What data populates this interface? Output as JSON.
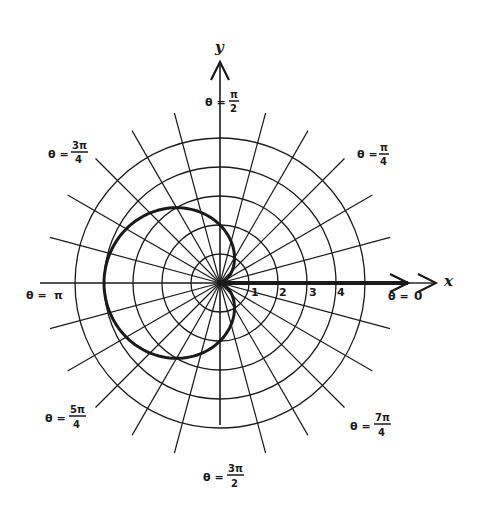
{
  "figure": {
    "title": "",
    "axes": {
      "x_label": "x",
      "y_label": "y"
    },
    "ring_tick_labels": [
      "1",
      "2",
      "3",
      "4"
    ],
    "angle_labels": [
      {
        "id": "theta_0",
        "prefix": "θ =",
        "num": "0",
        "den": ""
      },
      {
        "id": "theta_pi4",
        "prefix": "θ =",
        "num": "π",
        "den": "4"
      },
      {
        "id": "theta_pi2",
        "prefix": "θ =",
        "num": "π",
        "den": "2"
      },
      {
        "id": "theta_3pi4",
        "prefix": "θ =",
        "num": "3π",
        "den": "4"
      },
      {
        "id": "theta_pi",
        "prefix": "θ =",
        "num": "π",
        "den": ""
      },
      {
        "id": "theta_5pi4",
        "prefix": "θ =",
        "num": "5π",
        "den": "4"
      },
      {
        "id": "theta_3pi2",
        "prefix": "θ =",
        "num": "3π",
        "den": "2"
      },
      {
        "id": "theta_7pi4",
        "prefix": "θ =",
        "num": "7π",
        "den": "4"
      }
    ],
    "colors": {
      "ink": "#1a1a1a",
      "background": "#ffffff"
    }
  },
  "chart_data": {
    "type": "polar-line",
    "title": "",
    "curve": "r = 2 - 2cos(theta) (cardioid)",
    "grid": {
      "rings": [
        1,
        2,
        3,
        4,
        5
      ],
      "radial_lines_count": 24,
      "radial_step_deg": 15
    },
    "r_tick_labels": [
      "1",
      "2",
      "3",
      "4"
    ],
    "theta_labels": [
      "θ = 0",
      "θ = π/4",
      "θ = π/2",
      "θ = 3π/4",
      "θ = π",
      "θ = 5π/4",
      "θ = 3π/2",
      "θ = 7π/4"
    ],
    "series": [
      {
        "name": "cardioid",
        "theta_deg": [
          0,
          30,
          60,
          90,
          120,
          150,
          180,
          210,
          240,
          270,
          300,
          330,
          360
        ],
        "r": [
          0,
          0.27,
          1,
          2,
          3,
          3.73,
          4,
          3.73,
          3,
          2,
          1,
          0.27,
          0
        ]
      }
    ],
    "xlabel": "x",
    "ylabel": "y",
    "rlim": [
      0,
      5
    ]
  }
}
